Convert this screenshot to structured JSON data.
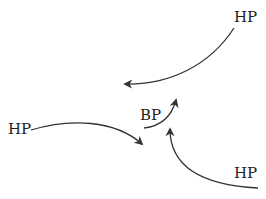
{
  "diagram": {
    "stroke_color": "#333333",
    "labels": {
      "hp_top": "HP",
      "hp_left": "HP",
      "hp_bottom": "HP",
      "bp_center": "BP"
    },
    "arrows": [
      {
        "from": "hp_top",
        "to": "center",
        "direction": "down-left"
      },
      {
        "from": "hp_left",
        "to": "center",
        "direction": "right"
      },
      {
        "from": "hp_bottom",
        "to": "center",
        "direction": "up"
      },
      {
        "from": "bp_center",
        "to": "center",
        "direction": "up-right"
      }
    ]
  }
}
